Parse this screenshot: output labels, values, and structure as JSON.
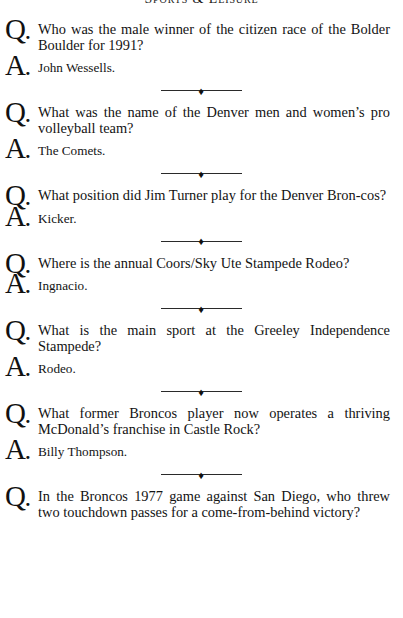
{
  "page": {
    "running_head": "Sports & Leisure",
    "ornament_glyph": "♦",
    "question_marker": "Q",
    "answer_marker": "A",
    "marker_period": ".",
    "ink_color": "#131313",
    "background_color": "#ffffff"
  },
  "entries": [
    {
      "question": "Who was the male winner of the citizen race of the Bolder Boulder for 1991?",
      "answer": "John Wessells."
    },
    {
      "question": "What was the name of the Denver men and women’s pro volleyball team?",
      "answer": "The Comets."
    },
    {
      "question": "What position did Jim Turner play for the Denver Bron-cos?",
      "answer": "Kicker."
    },
    {
      "question": "Where is the annual Coors/Sky Ute Stampede Rodeo?",
      "answer": "Ingnacio."
    },
    {
      "question": "What is the main sport at the Greeley Independence Stampede?",
      "answer": "Rodeo."
    },
    {
      "question": "What former Broncos player now operates a thriving McDonald’s franchise in Castle Rock?",
      "answer": "Billy Thompson."
    },
    {
      "question": "In the Broncos 1977 game against San Diego, who threw two touchdown passes for a come-from-behind victory?",
      "answer": ""
    }
  ]
}
